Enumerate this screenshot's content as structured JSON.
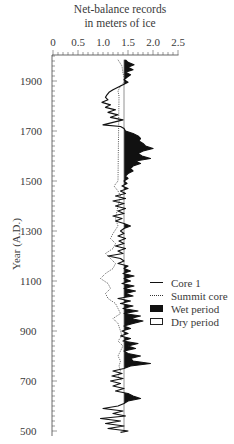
{
  "chart_data": {
    "type": "line",
    "title": "Net-balance records in meters of ice",
    "title_lines": [
      "Net-balance records",
      "in meters of ice"
    ],
    "xlabel": "Net-balance records in meters of ice",
    "ylabel": "Year (A.D.)",
    "xlim": [
      0,
      2.5
    ],
    "ylim": [
      500,
      1990
    ],
    "x_ticks": [
      "0",
      "0.5",
      "1.0",
      "1.5",
      "2.0",
      "2.5"
    ],
    "y_ticks": [
      "1900",
      "1700",
      "1500",
      "1300",
      "1100",
      "900",
      "700",
      "500"
    ],
    "x_axis_position": "top",
    "reference_value": 1.42,
    "legend": [
      "Core 1",
      "Summit core",
      "Wet period",
      "Dry period"
    ],
    "legend_position": "right",
    "grid": false,
    "series": [
      {
        "name": "Core 1",
        "style": "solid",
        "points": [
          [
            1985,
            1.45
          ],
          [
            1975,
            1.5
          ],
          [
            1965,
            1.62
          ],
          [
            1955,
            1.5
          ],
          [
            1945,
            1.6
          ],
          [
            1935,
            1.45
          ],
          [
            1925,
            1.55
          ],
          [
            1915,
            1.48
          ],
          [
            1905,
            1.42
          ],
          [
            1895,
            1.5
          ],
          [
            1885,
            1.4
          ],
          [
            1875,
            1.3
          ],
          [
            1865,
            1.2
          ],
          [
            1855,
            1.12
          ],
          [
            1845,
            1.08
          ],
          [
            1835,
            1.05
          ],
          [
            1825,
            1.1
          ],
          [
            1815,
            0.98
          ],
          [
            1805,
            1.15
          ],
          [
            1795,
            1.05
          ],
          [
            1785,
            1.25
          ],
          [
            1775,
            1.1
          ],
          [
            1765,
            1.3
          ],
          [
            1755,
            1.15
          ],
          [
            1745,
            1.4
          ],
          [
            1735,
            1.2
          ],
          [
            1725,
            1.0
          ],
          [
            1718,
            1.35
          ],
          [
            1710,
            1.42
          ],
          [
            1700,
            1.45
          ],
          [
            1690,
            1.6
          ],
          [
            1680,
            1.7
          ],
          [
            1670,
            1.75
          ],
          [
            1660,
            1.72
          ],
          [
            1650,
            1.8
          ],
          [
            1640,
            1.85
          ],
          [
            1630,
            2.0
          ],
          [
            1620,
            1.8
          ],
          [
            1610,
            1.7
          ],
          [
            1600,
            1.78
          ],
          [
            1590,
            1.95
          ],
          [
            1580,
            1.65
          ],
          [
            1570,
            1.75
          ],
          [
            1560,
            1.6
          ],
          [
            1550,
            1.55
          ],
          [
            1540,
            1.6
          ],
          [
            1530,
            1.5
          ],
          [
            1520,
            1.45
          ],
          [
            1510,
            1.5
          ],
          [
            1500,
            1.42
          ],
          [
            1490,
            1.48
          ],
          [
            1480,
            1.38
          ],
          [
            1470,
            1.5
          ],
          [
            1460,
            1.35
          ],
          [
            1450,
            1.45
          ],
          [
            1440,
            1.25
          ],
          [
            1430,
            1.45
          ],
          [
            1420,
            1.2
          ],
          [
            1410,
            1.42
          ],
          [
            1400,
            1.25
          ],
          [
            1390,
            1.45
          ],
          [
            1380,
            1.3
          ],
          [
            1370,
            1.42
          ],
          [
            1360,
            1.2
          ],
          [
            1350,
            1.38
          ],
          [
            1340,
            1.25
          ],
          [
            1330,
            1.42
          ],
          [
            1320,
            1.55
          ],
          [
            1310,
            1.42
          ],
          [
            1300,
            1.35
          ],
          [
            1290,
            1.42
          ],
          [
            1280,
            1.3
          ],
          [
            1270,
            1.45
          ],
          [
            1260,
            1.32
          ],
          [
            1250,
            1.42
          ],
          [
            1240,
            1.25
          ],
          [
            1230,
            1.45
          ],
          [
            1220,
            1.3
          ],
          [
            1210,
            1.4
          ],
          [
            1200,
            1.1
          ],
          [
            1190,
            1.35
          ],
          [
            1180,
            1.42
          ],
          [
            1170,
            1.3
          ],
          [
            1160,
            1.5
          ],
          [
            1150,
            1.42
          ],
          [
            1140,
            1.55
          ],
          [
            1130,
            1.4
          ],
          [
            1120,
            1.62
          ],
          [
            1110,
            1.42
          ],
          [
            1100,
            1.55
          ],
          [
            1090,
            1.38
          ],
          [
            1080,
            1.62
          ],
          [
            1070,
            1.42
          ],
          [
            1060,
            1.65
          ],
          [
            1050,
            1.45
          ],
          [
            1040,
            1.6
          ],
          [
            1030,
            1.3
          ],
          [
            1020,
            1.55
          ],
          [
            1010,
            1.35
          ],
          [
            1000,
            1.6
          ],
          [
            990,
            1.4
          ],
          [
            980,
            1.7
          ],
          [
            970,
            1.42
          ],
          [
            960,
            1.75
          ],
          [
            950,
            1.55
          ],
          [
            940,
            1.8
          ],
          [
            930,
            1.6
          ],
          [
            920,
            1.42
          ],
          [
            910,
            1.55
          ],
          [
            900,
            1.38
          ],
          [
            890,
            1.5
          ],
          [
            880,
            1.35
          ],
          [
            870,
            1.55
          ],
          [
            860,
            1.4
          ],
          [
            850,
            1.7
          ],
          [
            840,
            1.5
          ],
          [
            830,
            1.65
          ],
          [
            820,
            1.42
          ],
          [
            810,
            1.5
          ],
          [
            800,
            1.75
          ],
          [
            790,
            1.55
          ],
          [
            780,
            1.6
          ],
          [
            770,
            1.95
          ],
          [
            760,
            1.55
          ],
          [
            750,
            1.42
          ],
          [
            740,
            1.2
          ],
          [
            730,
            1.38
          ],
          [
            720,
            1.18
          ],
          [
            710,
            1.4
          ],
          [
            700,
            1.15
          ],
          [
            690,
            1.35
          ],
          [
            680,
            1.2
          ],
          [
            670,
            1.42
          ],
          [
            660,
            1.25
          ],
          [
            650,
            1.5
          ],
          [
            640,
            1.6
          ],
          [
            630,
            1.75
          ],
          [
            620,
            1.5
          ],
          [
            610,
            1.42
          ],
          [
            600,
            1.3
          ],
          [
            590,
            1.0
          ],
          [
            580,
            1.4
          ],
          [
            570,
            1.2
          ],
          [
            560,
            1.45
          ],
          [
            550,
            0.95
          ],
          [
            540,
            1.35
          ],
          [
            530,
            1.05
          ],
          [
            520,
            1.42
          ],
          [
            510,
            1.1
          ],
          [
            500,
            1.5
          ],
          [
            495,
            1.35
          ]
        ]
      },
      {
        "name": "Summit core",
        "style": "dotted",
        "points": [
          [
            1985,
            1.3
          ],
          [
            1960,
            1.38
          ],
          [
            1930,
            1.4
          ],
          [
            1900,
            1.45
          ],
          [
            1880,
            1.35
          ],
          [
            1860,
            1.3
          ],
          [
            1840,
            1.32
          ],
          [
            1500,
            1.3
          ],
          [
            1480,
            1.22
          ],
          [
            1460,
            1.3
          ],
          [
            1440,
            1.35
          ],
          [
            1400,
            1.3
          ],
          [
            1350,
            1.25
          ],
          [
            1320,
            1.3
          ],
          [
            1290,
            1.2
          ],
          [
            1270,
            1.15
          ],
          [
            1250,
            1.25
          ],
          [
            1230,
            1.2
          ],
          [
            1210,
            1.05
          ],
          [
            1190,
            1.15
          ],
          [
            1170,
            1.25
          ],
          [
            1150,
            1.2
          ],
          [
            1130,
            1.05
          ],
          [
            1110,
            0.95
          ],
          [
            1090,
            1.1
          ],
          [
            1070,
            1.15
          ],
          [
            1050,
            1.05
          ],
          [
            1030,
            1.1
          ],
          [
            1010,
            1.25
          ],
          [
            990,
            1.3
          ],
          [
            970,
            1.35
          ],
          [
            950,
            1.2
          ],
          [
            930,
            1.3
          ],
          [
            900,
            1.35
          ],
          [
            880,
            1.38
          ],
          [
            860,
            1.3
          ],
          [
            840,
            1.4
          ],
          [
            800,
            1.3
          ],
          [
            780,
            1.35
          ],
          [
            760,
            1.32
          ],
          [
            740,
            1.35
          ],
          [
            720,
            1.3
          ],
          [
            700,
            1.38
          ]
        ]
      }
    ],
    "annotations": [
      "Wet period: filled black where Core 1 > reference (1.42)",
      "Dry period: unfilled where Core 1 < reference"
    ]
  }
}
